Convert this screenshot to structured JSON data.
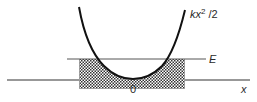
{
  "diagram": {
    "labels": {
      "potential_k": "k",
      "potential_x": "x",
      "potential_exp": "2",
      "potential_rest": " /2",
      "energy": "E",
      "origin": "0",
      "x_axis": "x"
    },
    "colors": {
      "curve": "#111111",
      "energy_line": "#555555",
      "axis": "#333333",
      "hatch": "#333333",
      "background": "#ffffff"
    },
    "geometry": {
      "vertex": [
        133,
        79
      ],
      "energy_level_y": 59,
      "energy_line_x": [
        67,
        206
      ],
      "axis_y": 80,
      "axis_x": [
        7,
        250
      ],
      "turning_points_x": [
        98,
        169
      ]
    }
  }
}
